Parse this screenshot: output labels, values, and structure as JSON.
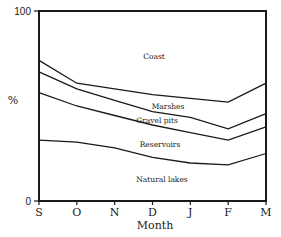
{
  "chart_data": {
    "type": "area",
    "stacked": true,
    "title": "",
    "xlabel": "Month",
    "ylabel": "%",
    "ylim": [
      0,
      100
    ],
    "y_ticks": [
      "0",
      "100"
    ],
    "categories": [
      "S",
      "O",
      "N",
      "D",
      "J",
      "F",
      "M"
    ],
    "boundaries_cumulative": [
      {
        "name": "Natural lakes / Reservoirs",
        "values": [
          32,
          31,
          28,
          23,
          20,
          19,
          25
        ]
      },
      {
        "name": "Reservoirs / Gravel pits",
        "values": [
          57,
          50,
          45,
          40,
          36,
          32,
          39
        ]
      },
      {
        "name": "Gravel pits / Marshes",
        "values": [
          68,
          59,
          53,
          47,
          44,
          38,
          46
        ]
      },
      {
        "name": "Marshes / Coast",
        "values": [
          74,
          62,
          59,
          56,
          54,
          52,
          62
        ]
      }
    ],
    "series": [
      {
        "name": "Natural lakes",
        "values": [
          32,
          31,
          28,
          23,
          20,
          19,
          25
        ]
      },
      {
        "name": "Reservoirs",
        "values": [
          25,
          19,
          17,
          17,
          16,
          13,
          14
        ]
      },
      {
        "name": "Gravel pits",
        "values": [
          11,
          9,
          8,
          7,
          8,
          6,
          7
        ]
      },
      {
        "name": "Marshes",
        "values": [
          6,
          3,
          6,
          9,
          10,
          14,
          16
        ]
      },
      {
        "name": "Coast",
        "values": [
          26,
          38,
          41,
          44,
          46,
          48,
          38
        ]
      }
    ],
    "region_labels": [
      {
        "text": "Coast",
        "x": 154,
        "y": 59
      },
      {
        "text": "Marshes",
        "x": 168,
        "y": 109
      },
      {
        "text": "Gravel pits",
        "x": 157,
        "y": 123
      },
      {
        "text": "Reservoirs",
        "x": 160,
        "y": 147
      },
      {
        "text": "Natural lakes",
        "x": 162,
        "y": 182
      }
    ],
    "grid": false,
    "legend": "inline labels"
  }
}
